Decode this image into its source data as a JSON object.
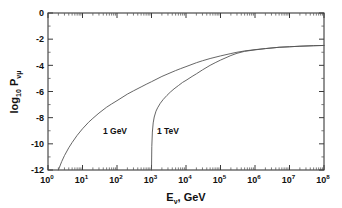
{
  "figure": {
    "background_color": "#ffffff",
    "curve_color": "#555555",
    "axis_color": "#3a3a3a",
    "text_color": "#111111"
  },
  "axes": {
    "x": {
      "title_main": "E",
      "title_sub": "ν",
      "title_rest": ", GeV",
      "tick_mantissa": "10",
      "tick_exponents": [
        "0",
        "1",
        "2",
        "3",
        "4",
        "5",
        "6",
        "7",
        "8"
      ],
      "scale": "log",
      "min_exp": 0,
      "max_exp": 8
    },
    "y": {
      "title_main": "log",
      "title_main_sub": "10",
      "title_symbol": "P",
      "title_symbol_sub": "νμ",
      "tick_labels": [
        "0",
        "-2",
        "-4",
        "-6",
        "-8",
        "-10",
        "-12"
      ],
      "tick_values": [
        0,
        -2,
        -4,
        -6,
        -8,
        -10,
        -12
      ],
      "scale": "linear",
      "min": -12,
      "max": 0
    }
  },
  "annotations": [
    {
      "label": "1 GeV",
      "x_px": 115,
      "y_px": 134
    },
    {
      "label": "1 TeV",
      "x_px": 168,
      "y_px": 134
    }
  ],
  "chart_data": {
    "type": "line",
    "title": "",
    "xlabel": "E_nu, GeV",
    "ylabel": "log10 P_numu",
    "xscale": "log",
    "yscale": "linear",
    "xlim": [
      1,
      100000000
    ],
    "ylim": [
      -12,
      0
    ],
    "grid": false,
    "legend": "in-plot annotations",
    "series": [
      {
        "name": "1 GeV",
        "annotation": "1 GeV",
        "comment": "muon energy threshold 1 GeV",
        "x": [
          2.0,
          2.5,
          3.0,
          4.0,
          5.0,
          7.0,
          10.0,
          15.0,
          20.0,
          30.0,
          50.0,
          70.0,
          100.0,
          200.0,
          300.0,
          500.0,
          700.0,
          1000.0,
          2000.0,
          3000.0,
          5000.0,
          7000.0,
          10000.0,
          20000.0,
          30000.0,
          50000.0,
          100000.0,
          200000.0,
          300000.0,
          500000.0,
          1000000.0,
          2000000.0,
          5000000.0,
          10000000.0,
          20000000.0,
          50000000.0,
          100000000.0
        ],
        "y": [
          -12.0,
          -11.35,
          -10.9,
          -10.3,
          -9.9,
          -9.35,
          -8.85,
          -8.35,
          -8.05,
          -7.65,
          -7.2,
          -6.95,
          -6.7,
          -6.2,
          -5.95,
          -5.65,
          -5.45,
          -5.25,
          -4.85,
          -4.65,
          -4.4,
          -4.25,
          -4.1,
          -3.8,
          -3.65,
          -3.48,
          -3.28,
          -3.1,
          -3.0,
          -2.9,
          -2.8,
          -2.72,
          -2.62,
          -2.58,
          -2.54,
          -2.5,
          -2.48
        ]
      },
      {
        "name": "1 TeV",
        "annotation": "1 TeV",
        "comment": "muon energy threshold 1 TeV, rises steeply at 10^3 GeV",
        "x": [
          1000.0,
          1020.0,
          1060.0,
          1120.0,
          1200.0,
          1350.0,
          1500.0,
          1800.0,
          2200.0,
          2800.0,
          3500.0,
          4500.0,
          6000.0,
          8000.0,
          10000.0,
          15000.0,
          20000.0,
          30000.0,
          50000.0,
          70000.0,
          100000.0,
          200000.0,
          300000.0,
          500000.0,
          1000000.0,
          2000000.0,
          5000000.0,
          10000000.0,
          20000000.0,
          50000000.0,
          100000000.0
        ],
        "y": [
          -12.0,
          -10.2,
          -9.1,
          -8.4,
          -7.95,
          -7.5,
          -7.25,
          -6.9,
          -6.6,
          -6.3,
          -6.05,
          -5.8,
          -5.55,
          -5.3,
          -5.15,
          -4.85,
          -4.65,
          -4.35,
          -4.0,
          -3.8,
          -3.6,
          -3.25,
          -3.08,
          -2.93,
          -2.82,
          -2.72,
          -2.62,
          -2.58,
          -2.54,
          -2.5,
          -2.48
        ]
      }
    ]
  }
}
